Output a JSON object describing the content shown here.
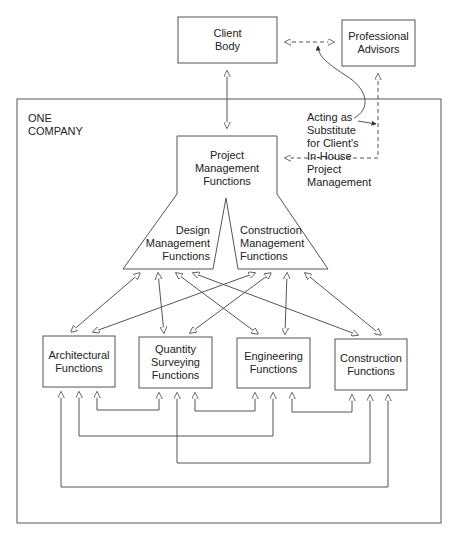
{
  "diagram": {
    "outer_box_label": "ONE\nCOMPANY",
    "nodes": {
      "client_body": "Client\nBody",
      "professional_advisors": "Professional\nAdvisors",
      "project_management": "Project\nManagement\nFunctions",
      "design_management": "Design\nManagement\nFunctions",
      "construction_management": "Construction\nManagement\nFunctions",
      "architectural": "Architectural\nFunctions",
      "quantity_surveying": "Quantity\nSurveying\nFunctions",
      "engineering": "Engineering\nFunctions",
      "construction": "Construction\nFunctions"
    },
    "annotation": "Acting as\nSubstitute\nfor Client's\nIn-House\nProject\nManagement",
    "colors": {
      "line": "#555555",
      "text": "#222222",
      "background": "#ffffff"
    }
  }
}
